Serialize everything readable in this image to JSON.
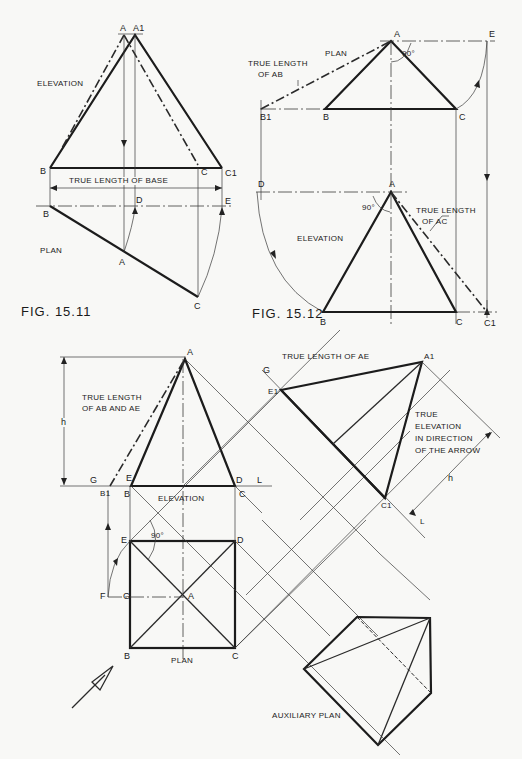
{
  "figures": {
    "fig1": {
      "caption": "FIG. 15.11",
      "labels": {
        "A": "A",
        "A1": "A1",
        "elevation": "ELEVATION",
        "B_top": "B",
        "C": "C",
        "C1": "C1",
        "true_length_base": "TRUE LENGTH   OF  BASE",
        "B_plan": "B",
        "D": "D",
        "E": "E",
        "plan": "PLAN",
        "A_plan": "A",
        "C_plan": "C"
      }
    },
    "fig2": {
      "caption": "FIG. 15.12",
      "labels": {
        "plan": "PLAN",
        "A": "A",
        "E": "E",
        "angle": "90°",
        "true_length_ab_1": "TRUE LENGTH",
        "true_length_ab_2": "OF AB",
        "B1": "B1",
        "B": "B",
        "C": "C",
        "D": "D",
        "A_elev": "A",
        "angle_elev": "90°",
        "true_length_ac_1": "TRUE LENGTH",
        "true_length_ac_2": "OF AC",
        "elevation": "ELEVATION",
        "B_elev": "B",
        "C_elev": "C",
        "C1": "C1"
      }
    },
    "fig3": {
      "labels": {
        "A": "A",
        "h": "h",
        "true_length_ab_ae_1": "TRUE LENGTH",
        "true_length_ab_ae_2": "OF AB AND AE",
        "G": "G",
        "E": "E",
        "D": "D",
        "L": "L",
        "B1": "B1",
        "B": "B",
        "C": "C",
        "elevation": "ELEVATION",
        "E_plan": "E",
        "D_plan": "D",
        "angle": "90°",
        "F": "F",
        "G_plan": "G",
        "A_plan": "A",
        "B_plan": "B",
        "C_plan": "C",
        "plan": "PLAN",
        "true_length_ae": "TRUE LENGTH OF AE",
        "G_aux": "G",
        "E1": "E1",
        "A1": "A1",
        "true_elev_1": "TRUE",
        "true_elev_2": "ELEVATION",
        "true_elev_3": "IN DIRECTION",
        "true_elev_4": "OF THE ARROW",
        "h_aux": "h",
        "C1": "C1",
        "L_aux": "L",
        "aux_plan": "AUXILIARY PLAN"
      }
    }
  }
}
